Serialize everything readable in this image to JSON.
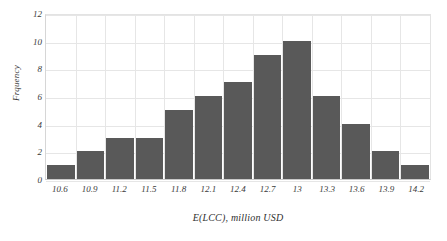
{
  "chart_data": {
    "type": "bar",
    "title": "",
    "subtitle": "",
    "xlabel": "E(LCC), million USD",
    "ylabel": "Frquency",
    "categories": [
      "10.6",
      "10.9",
      "11.2",
      "11.5",
      "11.8",
      "12.1",
      "12.4",
      "12.7",
      "13",
      "13.3",
      "13.6",
      "13.9",
      "14.2"
    ],
    "values": [
      1,
      2,
      3,
      3,
      5,
      6,
      7,
      9,
      10,
      6,
      4,
      2,
      1
    ],
    "ylim": [
      0,
      12
    ],
    "y_ticks": [
      "0",
      "2",
      "4",
      "6",
      "8",
      "10",
      "12"
    ],
    "y_tick_values": [
      0,
      2,
      4,
      6,
      8,
      10,
      12
    ],
    "grid": true,
    "legend": false,
    "legend_position": "none",
    "bar_color": "#595959",
    "gridline_color": "#e6e6e6",
    "background_color": "#ffffff",
    "text_color": "#3a3a3a"
  }
}
